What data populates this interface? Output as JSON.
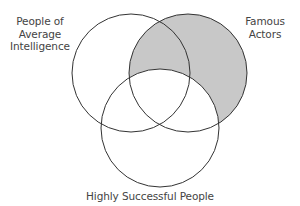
{
  "diagram": {
    "type": "venn",
    "sets": [
      {
        "id": "average",
        "label_lines": [
          "People of",
          "Average",
          "Intelligence"
        ],
        "cx": 131,
        "cy": 73,
        "r": 59
      },
      {
        "id": "actors",
        "label_lines": [
          "Famous",
          "Actors"
        ],
        "cx": 188,
        "cy": 73,
        "r": 59
      },
      {
        "id": "successful",
        "label_lines": [
          "Highly Successful People"
        ],
        "cx": 160,
        "cy": 128,
        "r": 59
      }
    ],
    "shaded_region": "Famous Actors not in Highly Successful People",
    "colors": {
      "stroke": "#333333",
      "shade": "#c8c8c8",
      "background": "#ffffff"
    }
  }
}
